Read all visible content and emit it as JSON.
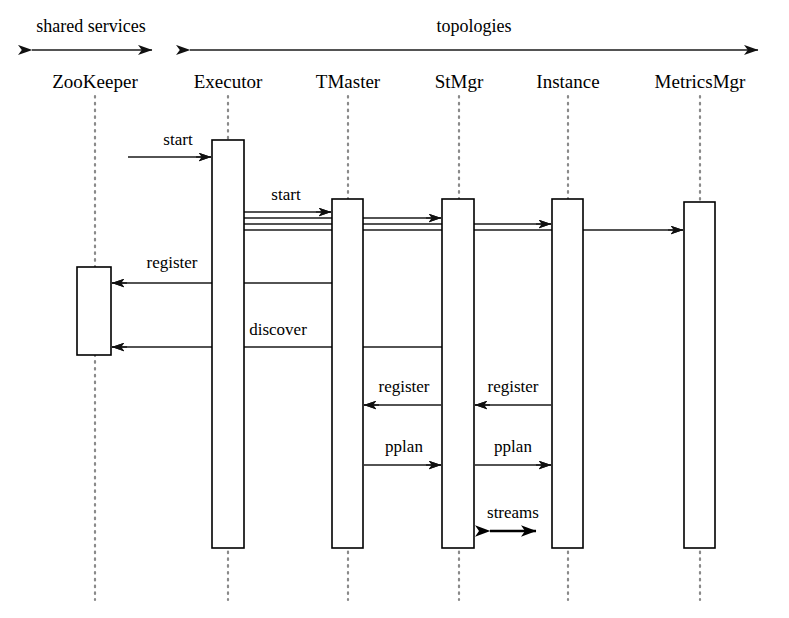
{
  "diagram": {
    "type": "sequence-diagram",
    "groups": [
      {
        "id": "shared-services",
        "label": "shared services",
        "x1": 18,
        "x2": 165,
        "label_x": 91,
        "label_y": 32,
        "axis_y": 50,
        "double_headed": true
      },
      {
        "id": "topologies",
        "label": "topologies",
        "x1": 176,
        "x2": 772,
        "label_x": 474,
        "label_y": 32,
        "axis_y": 50,
        "double_headed": true
      }
    ],
    "actors": [
      {
        "id": "zookeeper",
        "label": "ZooKeeper",
        "x": 95,
        "label_y": 88,
        "lifeline_top": 96,
        "lifeline_bottom": 600
      },
      {
        "id": "executor",
        "label": "Executor",
        "x": 228,
        "label_y": 88,
        "lifeline_top": 96,
        "lifeline_bottom": 600
      },
      {
        "id": "tmaster",
        "label": "TMaster",
        "x": 348,
        "label_y": 88,
        "lifeline_top": 96,
        "lifeline_bottom": 600
      },
      {
        "id": "stmgr",
        "label": "StMgr",
        "x": 459,
        "label_y": 88,
        "lifeline_top": 96,
        "lifeline_bottom": 600
      },
      {
        "id": "instance",
        "label": "Instance",
        "x": 568,
        "label_y": 88,
        "lifeline_top": 96,
        "lifeline_bottom": 600
      },
      {
        "id": "metricsmgr",
        "label": "MetricsMgr",
        "x": 700,
        "label_y": 88,
        "lifeline_top": 96,
        "lifeline_bottom": 600
      }
    ],
    "activations": [
      {
        "id": "act-executor",
        "actor": "executor",
        "x": 212,
        "y": 140,
        "w": 32,
        "h": 408
      },
      {
        "id": "act-zookeeper",
        "actor": "zookeeper",
        "x": 77,
        "y": 267,
        "w": 34,
        "h": 88
      },
      {
        "id": "act-tmaster",
        "actor": "tmaster",
        "x": 332,
        "y": 199,
        "w": 31,
        "h": 349
      },
      {
        "id": "act-stmgr",
        "actor": "stmgr",
        "x": 442,
        "y": 199,
        "w": 32,
        "h": 349
      },
      {
        "id": "act-instance",
        "actor": "instance",
        "x": 552,
        "y": 199,
        "w": 31,
        "h": 349
      },
      {
        "id": "act-metricsmgr",
        "actor": "metricsmgr",
        "x": 684,
        "y": 202,
        "w": 31,
        "h": 346
      }
    ],
    "messages": [
      {
        "id": "msg-start-executor",
        "label": "start",
        "label_x": 178,
        "label_y": 145,
        "from_x": 128,
        "to_x": 211,
        "y": 157,
        "direction": "right",
        "arrow": "single"
      },
      {
        "id": "msg-start-tmaster",
        "label": "start",
        "label_x": 286,
        "label_y": 200,
        "from_x": 244,
        "to_x": 331,
        "y": 212,
        "direction": "right",
        "arrow": "single"
      },
      {
        "id": "msg-start-stmgr",
        "label": "",
        "label_x": 0,
        "label_y": 0,
        "from_x": 244,
        "to_x": 441,
        "y": 218,
        "direction": "right",
        "arrow": "single"
      },
      {
        "id": "msg-start-instance",
        "label": "",
        "label_x": 0,
        "label_y": 0,
        "from_x": 244,
        "to_x": 551,
        "y": 224,
        "direction": "right",
        "arrow": "single"
      },
      {
        "id": "msg-start-metricsmgr",
        "label": "",
        "label_x": 0,
        "label_y": 0,
        "from_x": 244,
        "to_x": 683,
        "y": 230,
        "direction": "right",
        "arrow": "single"
      },
      {
        "id": "msg-register-zk",
        "label": "register",
        "label_x": 172,
        "label_y": 268,
        "from_x": 341,
        "to_x": 112,
        "y": 283,
        "direction": "left",
        "arrow": "single"
      },
      {
        "id": "msg-discover-zk",
        "label": "discover",
        "label_x": 278,
        "label_y": 335,
        "from_x": 452,
        "to_x": 112,
        "y": 347,
        "direction": "left",
        "arrow": "single"
      },
      {
        "id": "msg-register-tmaster",
        "label": "register",
        "label_x": 404,
        "label_y": 392,
        "from_x": 441,
        "to_x": 364,
        "y": 405,
        "direction": "left",
        "arrow": "single"
      },
      {
        "id": "msg-register-stmgr",
        "label": "register",
        "label_x": 513,
        "label_y": 392,
        "from_x": 551,
        "to_x": 475,
        "y": 405,
        "direction": "left",
        "arrow": "single"
      },
      {
        "id": "msg-pplan-stmgr",
        "label": "pplan",
        "label_x": 404,
        "label_y": 452,
        "from_x": 364,
        "to_x": 441,
        "y": 465,
        "direction": "right",
        "arrow": "single"
      },
      {
        "id": "msg-pplan-instance",
        "label": "pplan",
        "label_x": 513,
        "label_y": 452,
        "from_x": 475,
        "to_x": 551,
        "y": 465,
        "direction": "right",
        "arrow": "single"
      },
      {
        "id": "msg-streams",
        "label": "streams",
        "label_x": 513,
        "label_y": 518,
        "from_x": 475,
        "to_x": 551,
        "y": 531,
        "direction": "both",
        "arrow": "double"
      }
    ]
  }
}
